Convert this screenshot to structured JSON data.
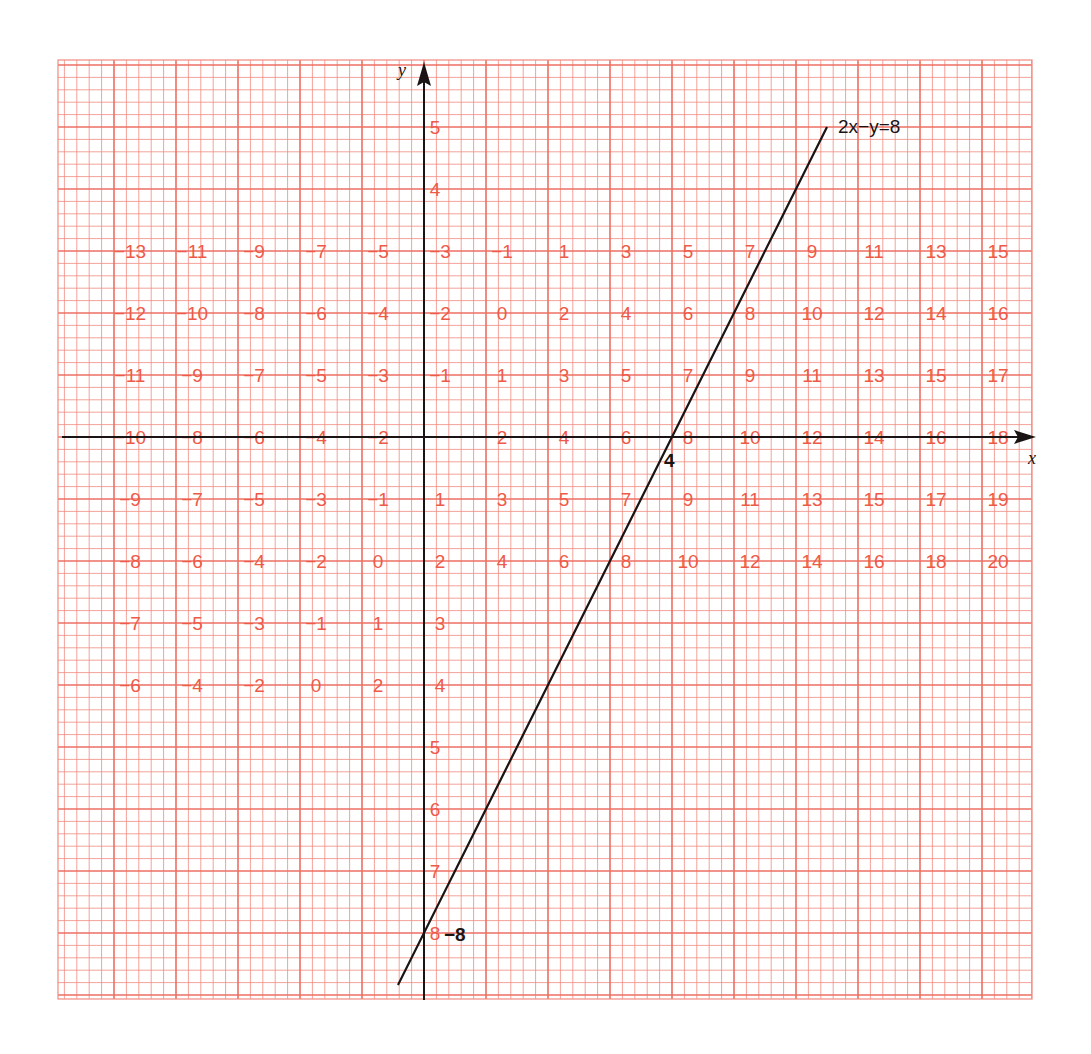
{
  "chart_data": {
    "type": "line",
    "title": "",
    "equation_label": "2x−y=8",
    "xlabel": "x",
    "ylabel": "y",
    "xlim": [
      -5.9,
      9.8
    ],
    "ylim": [
      -9.0,
      6.0
    ],
    "grid": true,
    "origin_px": [
      424,
      437
    ],
    "unit_px": 62,
    "grid_box_px": {
      "left": 58,
      "top": 60,
      "right": 1032,
      "bottom": 999
    },
    "colors": {
      "grid": "#f08a80",
      "grid_major": "#ec6f63",
      "label": "#ee5a48",
      "ink": "#1a1414"
    },
    "series": [
      {
        "name": "2x−y=8",
        "x": [
          -0.42,
          6.5
        ],
        "y": [
          -8.84,
          5.0
        ]
      }
    ],
    "intercept_labels": [
      {
        "text": "4",
        "x": 4,
        "y": 0,
        "dx": -8,
        "dy": 30
      },
      {
        "text": "−8",
        "x": 0,
        "y": -8,
        "dx": 20,
        "dy": 8
      }
    ],
    "value_rows": [
      {
        "y": 3,
        "x_start": -5,
        "values": [
          "−13",
          "−11",
          "−9",
          "−7",
          "−5",
          "−3",
          "−1",
          "1",
          "3",
          "5",
          "7",
          "9",
          "11",
          "13",
          "15"
        ]
      },
      {
        "y": 2,
        "x_start": -5,
        "values": [
          "−12",
          "−10",
          "−8",
          "−6",
          "−4",
          "−2",
          "0",
          "2",
          "4",
          "6",
          "8",
          "10",
          "12",
          "14",
          "16"
        ]
      },
      {
        "y": 1,
        "x_start": -5,
        "values": [
          "−11",
          "−9",
          "−7",
          "−5",
          "−3",
          "−1",
          "1",
          "3",
          "5",
          "7",
          "9",
          "11",
          "13",
          "15",
          "17"
        ]
      },
      {
        "y": 0,
        "x_start": -5,
        "values": [
          "−10",
          "−8",
          "−6",
          "−4",
          "−2",
          "",
          "2",
          "4",
          "6",
          "8",
          "10",
          "12",
          "14",
          "16",
          "18"
        ]
      },
      {
        "y": -1,
        "x_start": -5,
        "values": [
          "−9",
          "−7",
          "−5",
          "−3",
          "−1",
          "1",
          "3",
          "5",
          "7",
          "9",
          "11",
          "13",
          "15",
          "17",
          "19"
        ]
      },
      {
        "y": -2,
        "x_start": -5,
        "values": [
          "−8",
          "−6",
          "−4",
          "−2",
          "0",
          "2",
          "4",
          "6",
          "8",
          "10",
          "12",
          "14",
          "16",
          "18",
          "20"
        ]
      },
      {
        "y": -3,
        "x_start": -5,
        "values": [
          "−7",
          "−5",
          "−3",
          "−1",
          "1",
          "3"
        ]
      },
      {
        "y": -4,
        "x_start": -5,
        "values": [
          "−6",
          "−4",
          "−2",
          "0",
          "2",
          "4"
        ]
      }
    ],
    "y_axis_values": [
      {
        "y": 5,
        "text": "5"
      },
      {
        "y": 4,
        "text": "4"
      },
      {
        "y": -5,
        "text": "5"
      },
      {
        "y": -6,
        "text": "6"
      },
      {
        "y": -7,
        "text": "7"
      },
      {
        "y": -8,
        "text": "8"
      }
    ]
  }
}
